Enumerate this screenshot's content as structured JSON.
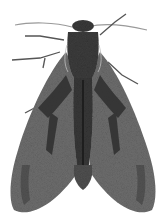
{
  "image": {
    "subject": "moth",
    "style": "grayscale illustration",
    "background": "#ffffff",
    "colors": {
      "wing": "#6a6a6a",
      "wing_dark": "#2e2e2e",
      "body": "#3a3a3a",
      "antenna": "#9a9a9a",
      "legs": "#555555"
    }
  }
}
